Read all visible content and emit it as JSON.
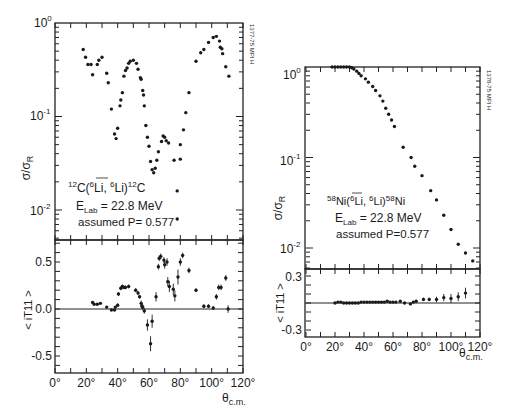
{
  "figure": {
    "left": {
      "id_label": "1377-75 MPI H",
      "reaction": {
        "pre": "12",
        "main": "C(",
        "proj_sup": "6",
        "proj": "Li",
        "comma": ", ",
        "ej_sup": "6",
        "ej": "Li)",
        "post_sup": "12",
        "post": "C"
      },
      "energy": {
        "prefix": "E",
        "sub": "Lab",
        "value": " = 22.8 MeV"
      },
      "polarization": "assumed  P= 0.577",
      "top_ylabel": {
        "main": "σ/σ",
        "sub": "R"
      },
      "bottom_ylabel": "< iT11 >",
      "xlabel": {
        "main": "θ",
        "sub": "c.m."
      },
      "top_yticks": [
        {
          "base": "10",
          "exp": "0"
        },
        {
          "base": "10",
          "exp": "-1"
        },
        {
          "base": "10",
          "exp": "-2"
        }
      ],
      "bottom_yticks": [
        "0.5",
        "0.0",
        "-0.5"
      ],
      "xticks": [
        "0°",
        "20°",
        "40°",
        "60°",
        "80°",
        "100°",
        "120°"
      ]
    },
    "right": {
      "id_label": "1378-75 MPI H",
      "reaction": {
        "pre": "58",
        "main": "Ni(",
        "proj_sup": "6",
        "proj": "Li",
        "comma": ", ",
        "ej_sup": "6",
        "ej": "Li)",
        "post_sup": "58",
        "post": "Ni"
      },
      "energy": {
        "prefix": "E",
        "sub": "Lab",
        "value": " = 22.8 MeV"
      },
      "polarization": "assumed  P=0.577",
      "top_ylabel": {
        "main": "σ/σ",
        "sub": "R"
      },
      "bottom_ylabel": "< iT11 >",
      "xlabel": {
        "main": "θ",
        "sub": "c.m."
      },
      "top_yticks": [
        {
          "base": "10",
          "exp": "0"
        },
        {
          "base": "10",
          "exp": "-1"
        },
        {
          "base": "10",
          "exp": "-2"
        }
      ],
      "bottom_yticks": [
        "0.3",
        "-0.3"
      ],
      "xticks": [
        "0°",
        "20°",
        "40°",
        "60°",
        "80°",
        "100°",
        "120°"
      ]
    }
  },
  "chart_data": [
    {
      "type": "scatter",
      "title": "12C(6Li pol, 6Li)12C, E_Lab = 22.8 MeV, assumed P = 0.577",
      "panel": "left-top",
      "xlabel": "θ c.m. (deg)",
      "ylabel": "σ/σR",
      "yscale": "log",
      "xlim": [
        0,
        120
      ],
      "ylim": [
        0.005,
        1.0
      ],
      "x": [
        18,
        19.5,
        21,
        23,
        24,
        27,
        28,
        30,
        33,
        34,
        36,
        38,
        39,
        40,
        41.5,
        42,
        43,
        44,
        45,
        46,
        47,
        48,
        50,
        52,
        53,
        54.5,
        55,
        56,
        56.5,
        57,
        58,
        59,
        60,
        61,
        62,
        63,
        64,
        65,
        66,
        68,
        69,
        70,
        71,
        72.5,
        76,
        78,
        78,
        80,
        80,
        82,
        83.5,
        85.5,
        90,
        93,
        95,
        98,
        101,
        103,
        105,
        105.5,
        106.5,
        107,
        109,
        111
      ],
      "y": [
        0.52,
        0.43,
        0.36,
        0.36,
        0.28,
        0.36,
        0.4,
        0.43,
        0.29,
        0.23,
        0.12,
        0.065,
        0.058,
        0.075,
        0.13,
        0.15,
        0.18,
        0.27,
        0.31,
        0.33,
        0.37,
        0.39,
        0.4,
        0.37,
        0.32,
        0.26,
        0.25,
        0.19,
        0.17,
        0.13,
        0.08,
        0.06,
        0.048,
        0.033,
        0.027,
        0.025,
        0.028,
        0.034,
        0.042,
        0.054,
        0.062,
        0.06,
        0.055,
        0.052,
        0.034,
        0.016,
        0.008,
        0.035,
        0.05,
        0.072,
        0.11,
        0.18,
        0.39,
        0.48,
        0.52,
        0.62,
        0.7,
        0.72,
        0.64,
        0.55,
        0.53,
        0.47,
        0.34,
        0.27
      ]
    },
    {
      "type": "scatter",
      "title": "12C(6Li pol, 6Li)12C analyzing power",
      "panel": "left-bottom",
      "xlabel": "θ c.m. (deg)",
      "ylabel": "< iT11 >",
      "xlim": [
        0,
        120
      ],
      "ylim": [
        -0.68,
        0.75
      ],
      "x": [
        24,
        25,
        27,
        29,
        33,
        36,
        38,
        38.5,
        40,
        40.5,
        42,
        43,
        44,
        45,
        47,
        51.5,
        53,
        54,
        55,
        55.5,
        56,
        57,
        59,
        61,
        62,
        64.5,
        66,
        66.5,
        67.5,
        69.5,
        70,
        71.5,
        72,
        73,
        75.5,
        76.5,
        78.5,
        80,
        81.5,
        85.5,
        90,
        95,
        98,
        101,
        103,
        104.5,
        106,
        109,
        110.5
      ],
      "y": [
        0.07,
        0.05,
        0.05,
        0.06,
        0.02,
        -0.01,
        -0.01,
        0.02,
        0.04,
        0.16,
        0.22,
        0.24,
        0.23,
        0.23,
        0.24,
        0.2,
        0.17,
        0.13,
        0.06,
        0.03,
        0.02,
        -0.02,
        -0.17,
        -0.37,
        -0.13,
        0.13,
        0.45,
        0.54,
        0.56,
        0.52,
        0.47,
        0.5,
        0.29,
        0.24,
        0.21,
        0.14,
        0.34,
        0.5,
        0.57,
        0.41,
        0.2,
        0.03,
        0.03,
        0.01,
        0.13,
        0.23,
        0.23,
        0.33,
        0.0
      ],
      "err": [
        0.01,
        0.01,
        0.01,
        0.01,
        0.01,
        0.01,
        0.01,
        0.01,
        0.02,
        0.02,
        0.02,
        0.02,
        0.02,
        0.02,
        0.02,
        0.02,
        0.02,
        0.02,
        0.03,
        0.03,
        0.03,
        0.03,
        0.06,
        0.08,
        0.07,
        0.05,
        0.03,
        0.03,
        0.03,
        0.03,
        0.04,
        0.04,
        0.05,
        0.06,
        0.06,
        0.06,
        0.08,
        0.04,
        0.03,
        0.03,
        0.02,
        0.02,
        0.02,
        0.02,
        0.03,
        0.03,
        0.03,
        0.03,
        0.04
      ]
    },
    {
      "type": "scatter",
      "title": "58Ni(6Li pol, 6Li)58Ni, E_Lab = 22.8 MeV, assumed P = 0.577",
      "panel": "right-top",
      "xlabel": "θ c.m. (deg)",
      "ylabel": "σ/σR",
      "yscale": "log",
      "xlim": [
        0,
        120
      ],
      "ylim": [
        0.0065,
        1.0
      ],
      "x": [
        18,
        20,
        22,
        24,
        26,
        28,
        30,
        31.5,
        33,
        35,
        36.5,
        38,
        41,
        43,
        46,
        48,
        51,
        53,
        55,
        57,
        59,
        61,
        67,
        72.5,
        75,
        80,
        86,
        90,
        95,
        100,
        105,
        110,
        115
      ],
      "y": [
        1.0,
        1.0,
        1.0,
        1.0,
        1.0,
        1.0,
        1.0,
        0.98,
        0.95,
        0.9,
        0.85,
        0.8,
        0.74,
        0.68,
        0.61,
        0.55,
        0.48,
        0.42,
        0.35,
        0.3,
        0.26,
        0.22,
        0.13,
        0.1,
        0.08,
        0.063,
        0.043,
        0.034,
        0.023,
        0.016,
        0.011,
        0.0088,
        0.0072
      ]
    },
    {
      "type": "scatter",
      "title": "58Ni(6Li pol, 6Li)58Ni analyzing power",
      "panel": "right-bottom",
      "xlabel": "θ c.m. (deg)",
      "ylabel": "< iT11 >",
      "xlim": [
        0,
        120
      ],
      "ylim": [
        -0.38,
        0.37
      ],
      "x": [
        20,
        22,
        24,
        26,
        28,
        30,
        32,
        34,
        36,
        38,
        40,
        42,
        44,
        46,
        48,
        50,
        52,
        54,
        56,
        58,
        60,
        62,
        65,
        68,
        72,
        74,
        76,
        81,
        85,
        90,
        95,
        100,
        105,
        110
      ],
      "y": [
        0.0,
        0.01,
        0.01,
        0.0,
        0.0,
        0.0,
        0.0,
        0.0,
        0.0,
        0.01,
        0.01,
        0.01,
        0.01,
        0.01,
        0.01,
        0.01,
        0.01,
        0.01,
        0.02,
        0.01,
        0.01,
        0.01,
        0.02,
        0.0,
        -0.01,
        0.01,
        0.02,
        0.04,
        0.04,
        0.04,
        0.06,
        0.05,
        0.07,
        0.11
      ],
      "err": [
        0.01,
        0.01,
        0.01,
        0.01,
        0.01,
        0.01,
        0.01,
        0.01,
        0.01,
        0.01,
        0.01,
        0.01,
        0.01,
        0.01,
        0.01,
        0.01,
        0.01,
        0.01,
        0.01,
        0.01,
        0.01,
        0.01,
        0.01,
        0.01,
        0.01,
        0.01,
        0.01,
        0.02,
        0.02,
        0.03,
        0.04,
        0.05,
        0.05,
        0.06
      ]
    }
  ]
}
